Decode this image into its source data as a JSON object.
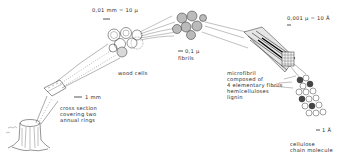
{
  "diagram": {
    "colors": {
      "ink": "#2a2a2a",
      "background": "#ffffff"
    },
    "labels": {
      "scale_wood_cells": "0,01 mm = 10 µ",
      "wood_cells": "wood cells",
      "scale_fibrils": "0,1 µ",
      "fibrils": "fibrils",
      "scale_microfibril": "0,001 µ = 10 Å",
      "microfibril_lines": [
        "microfibril",
        "composed of",
        "4 elementary fibrils",
        "hemicelluloses",
        "lignin"
      ],
      "scale_cross_section": "1 mm",
      "cross_section_lines": [
        "cross section",
        "covering two",
        "annual rings"
      ],
      "scale_molecule": "1 Å",
      "molecule_lines": [
        "cellulose",
        "chain molecule"
      ]
    },
    "nodes": [
      {
        "id": "tree-stump",
        "label": "tree stump"
      },
      {
        "id": "cross-section",
        "label": "cross section covering two annual rings",
        "scale": "1 mm"
      },
      {
        "id": "wood-cells",
        "label": "wood cells",
        "scale": "0,01 mm = 10 µ"
      },
      {
        "id": "fibrils",
        "label": "fibrils",
        "scale": "0,1 µ"
      },
      {
        "id": "microfibril",
        "label": "microfibril composed of 4 elementary fibrils, hemicelluloses, lignin",
        "scale": "0,001 µ = 10 Å"
      },
      {
        "id": "cellulose-chain",
        "label": "cellulose chain molecule",
        "scale": "1 Å"
      }
    ],
    "edges": [
      {
        "from": "tree-stump",
        "to": "cross-section"
      },
      {
        "from": "cross-section",
        "to": "wood-cells"
      },
      {
        "from": "wood-cells",
        "to": "fibrils"
      },
      {
        "from": "fibrils",
        "to": "microfibril"
      },
      {
        "from": "microfibril",
        "to": "cellulose-chain"
      }
    ]
  }
}
